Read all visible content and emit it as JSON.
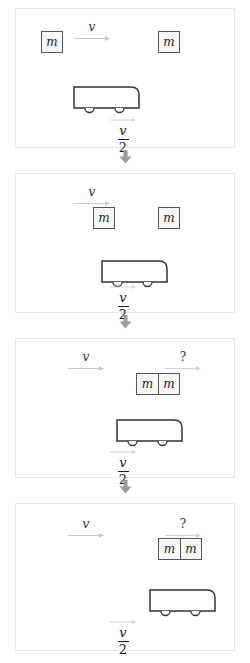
{
  "figure": {
    "type": "physics-sequence-diagram",
    "topic": "momentum-collision",
    "panel_count": 4,
    "colors": {
      "panel_border": "#e8e8e8",
      "panel_background": "#ffffff",
      "block_fill": "#f7f7f7",
      "block_border": "#555555",
      "truck_stroke": "#333333",
      "connector_arrow": "#9a9a9a",
      "label_text": "#1a1a1a",
      "velocity_arrow": "#c9c9c9"
    },
    "labels": {
      "mass": "m",
      "velocity": "v",
      "unknown": "?",
      "fraction_numerator": "v",
      "fraction_denominator": "2"
    },
    "connector_icon": "down-arrow-icon",
    "panels": [
      {
        "index": 1,
        "caption_top_left": "v",
        "caption_top_right": "",
        "blocks": [
          {
            "label": "m",
            "x": 40,
            "y": 38,
            "size": 22
          },
          {
            "label": "m",
            "x": 157,
            "y": 38,
            "size": 22
          }
        ],
        "joined_block": null,
        "truck": {
          "x": 72,
          "y": 93,
          "width": 66,
          "height": 22
        },
        "truck_speed_numerator": "v",
        "truck_speed_denominator": "2"
      },
      {
        "index": 2,
        "caption_top_left": "v",
        "caption_top_right": "",
        "blocks": [
          {
            "label": "m",
            "x": 92,
            "y": 206,
            "size": 22
          },
          {
            "label": "m",
            "x": 157,
            "y": 206,
            "size": 22
          }
        ],
        "joined_block": null,
        "truck": {
          "x": 100,
          "y": 259,
          "width": 66,
          "height": 22
        },
        "truck_speed_numerator": "v",
        "truck_speed_denominator": "2"
      },
      {
        "index": 3,
        "caption_top_left": "v",
        "caption_top_right": "?",
        "blocks": [],
        "joined_block": {
          "labels": [
            "m",
            "m"
          ],
          "x": 135,
          "y": 372,
          "width": 44,
          "height": 22
        },
        "truck": {
          "x": 115,
          "y": 426,
          "width": 66,
          "height": 22
        },
        "truck_speed_numerator": "v",
        "truck_speed_denominator": "2"
      },
      {
        "index": 4,
        "caption_top_left": "v",
        "caption_top_right": "?",
        "blocks": [],
        "joined_block": {
          "labels": [
            "m",
            "m"
          ],
          "x": 157,
          "y": 537,
          "width": 44,
          "height": 22
        },
        "truck": {
          "x": 148,
          "y": 592,
          "width": 66,
          "height": 22
        },
        "truck_speed_numerator": "v",
        "truck_speed_denominator": "2"
      }
    ]
  }
}
